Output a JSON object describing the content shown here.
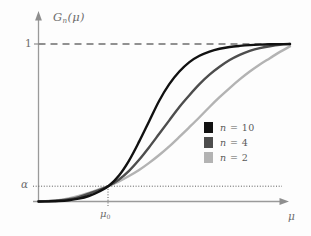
{
  "figure": {
    "background_color": "#fdfdfd",
    "axis_color": "#9a9a9a",
    "text_color": "#6d6d6d"
  },
  "axes": {
    "y_axis_label": "G",
    "y_axis_label_sub": "n",
    "y_axis_label_arg": "(μ)",
    "y_tick_top_label": "1",
    "y_tick_alpha_label": "α",
    "x_axis_label": "μ",
    "x_tick_label": "μ",
    "x_tick_label_sub": "0"
  },
  "legend": {
    "entries": [
      {
        "swatch_name": "legend-swatch-n10",
        "color": "#111111",
        "var": "n",
        "eq": " =  10"
      },
      {
        "swatch_name": "legend-swatch-n4",
        "color": "#4d4d4d",
        "var": "n",
        "eq": " =  4"
      },
      {
        "swatch_name": "legend-swatch-n2",
        "color": "#b3b3b3",
        "var": "n",
        "eq": " =  2"
      }
    ]
  },
  "chart_data": {
    "type": "line",
    "title": "",
    "xlabel": "μ",
    "ylabel": "G_n(μ)",
    "xlim": [
      0,
      1
    ],
    "ylim": [
      0,
      1.08
    ],
    "grid": false,
    "legend_position": "center-right",
    "annotations": [
      {
        "text": "1",
        "type": "y-tick",
        "value": 1
      },
      {
        "text": "α",
        "type": "y-tick",
        "value": 0.1
      },
      {
        "text": "μ_0",
        "type": "x-tick",
        "value": 0.28
      }
    ],
    "reference_lines": [
      {
        "name": "y-equals-one-dashed",
        "orientation": "horizontal",
        "y": 1,
        "style": "dashed",
        "color": "#6d6d6d"
      },
      {
        "name": "y-equals-alpha-dotted",
        "orientation": "horizontal",
        "y": 0.1,
        "style": "dotted",
        "color": "#5a5a5a"
      },
      {
        "name": "x-equals-mu0-dotted",
        "orientation": "vertical",
        "x": 0.28,
        "style": "dotted",
        "color": "#5a5a5a"
      }
    ],
    "crossing_point": {
      "x": 0.28,
      "y": 0.1,
      "labels": [
        "μ_0",
        "α"
      ]
    },
    "x": [
      0,
      0.04,
      0.08,
      0.12,
      0.16,
      0.2,
      0.24,
      0.28,
      0.32,
      0.36,
      0.4,
      0.44,
      0.48,
      0.52,
      0.56,
      0.6,
      0.64,
      0.68,
      0.72,
      0.76,
      0.8,
      0.84,
      0.88,
      0.92,
      0.96,
      1
    ],
    "series": [
      {
        "name": "n = 10",
        "n": 10,
        "color": "#111111",
        "values": [
          0.0,
          0.001,
          0.003,
          0.008,
          0.018,
          0.035,
          0.062,
          0.1,
          0.165,
          0.26,
          0.38,
          0.51,
          0.64,
          0.745,
          0.825,
          0.885,
          0.925,
          0.952,
          0.97,
          0.981,
          0.988,
          0.993,
          0.996,
          0.998,
          0.999,
          1.0
        ]
      },
      {
        "name": "n = 4",
        "n": 4,
        "color": "#4d4d4d",
        "values": [
          0.0,
          0.002,
          0.006,
          0.014,
          0.028,
          0.05,
          0.072,
          0.1,
          0.14,
          0.195,
          0.265,
          0.345,
          0.43,
          0.515,
          0.6,
          0.675,
          0.745,
          0.805,
          0.855,
          0.898,
          0.931,
          0.956,
          0.974,
          0.986,
          0.995,
          1.0
        ]
      },
      {
        "name": "n = 2",
        "n": 2,
        "color": "#b3b3b3",
        "values": [
          0.0,
          0.003,
          0.009,
          0.02,
          0.035,
          0.055,
          0.077,
          0.1,
          0.128,
          0.162,
          0.2,
          0.245,
          0.295,
          0.35,
          0.41,
          0.472,
          0.535,
          0.6,
          0.662,
          0.72,
          0.775,
          0.825,
          0.87,
          0.91,
          0.95,
          0.985
        ]
      }
    ]
  }
}
